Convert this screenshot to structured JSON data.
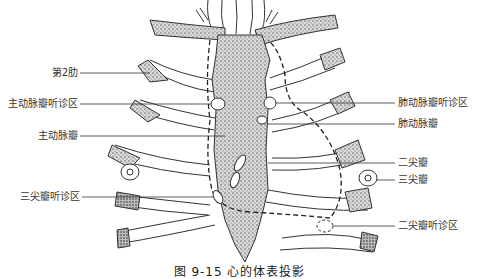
{
  "figure": {
    "caption": "图 9-15   心的体表投影",
    "labels_left": [
      {
        "id": "rib2",
        "text": "第2肋",
        "y": 73
      },
      {
        "id": "aortic-auscultation",
        "text": "主动脉瓣听诊区",
        "y": 104
      },
      {
        "id": "aortic-valve",
        "text": "主动脉瓣",
        "y": 136
      },
      {
        "id": "tricuspid-auscultation",
        "text": "三尖瓣听诊区",
        "y": 197
      }
    ],
    "labels_right": [
      {
        "id": "pulmonary-auscultation",
        "text": "肺动脉瓣听诊区",
        "y": 103
      },
      {
        "id": "pulmonary-valve",
        "text": "肺动脉瓣",
        "y": 124
      },
      {
        "id": "mitral-valve",
        "text": "二尖瓣",
        "y": 163
      },
      {
        "id": "tricuspid-valve",
        "text": "三尖瓣",
        "y": 180
      },
      {
        "id": "mitral-auscultation",
        "text": "二尖瓣听诊区",
        "y": 226
      }
    ]
  }
}
